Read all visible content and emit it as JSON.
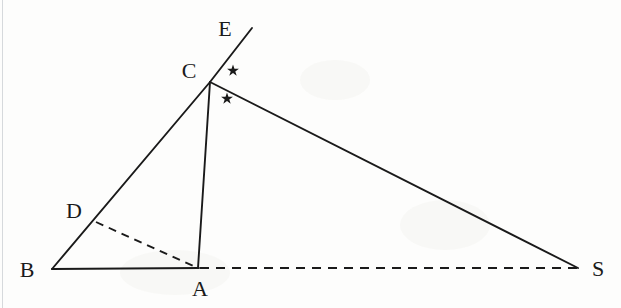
{
  "figure": {
    "type": "geometry-diagram",
    "background_color": "#fdfdfc",
    "stroke_color": "#1a1a1a",
    "labels": [
      {
        "name": "E",
        "text": "E",
        "x": 225,
        "y": 29
      },
      {
        "name": "C",
        "text": "C",
        "x": 189,
        "y": 71
      },
      {
        "name": "D",
        "text": "D",
        "x": 74,
        "y": 211
      },
      {
        "name": "B",
        "text": "B",
        "x": 27,
        "y": 270
      },
      {
        "name": "A",
        "text": "A",
        "x": 200,
        "y": 289
      },
      {
        "name": "S",
        "text": "S",
        "x": 598,
        "y": 269
      }
    ],
    "points": [
      {
        "name": "E",
        "x": 252,
        "y": 28
      },
      {
        "name": "C",
        "x": 210,
        "y": 82
      },
      {
        "name": "D",
        "x": 96,
        "y": 222
      },
      {
        "name": "B",
        "x": 52,
        "y": 269
      },
      {
        "name": "A",
        "x": 198,
        "y": 268
      },
      {
        "name": "S",
        "x": 578,
        "y": 268
      }
    ],
    "segments": [
      {
        "name": "segment-B-C",
        "from": "B",
        "to": "C",
        "style": "solid"
      },
      {
        "name": "segment-C-E",
        "from": "C",
        "to": "E",
        "style": "solid"
      },
      {
        "name": "segment-C-A",
        "from": "C",
        "to": "A",
        "style": "solid"
      },
      {
        "name": "segment-C-S",
        "from": "C",
        "to": "S",
        "style": "solid"
      },
      {
        "name": "segment-B-A",
        "from": "B",
        "to": "A",
        "style": "solid"
      },
      {
        "name": "segment-D-A",
        "from": "D",
        "to": "A",
        "style": "dashed"
      },
      {
        "name": "segment-A-S",
        "from": "A",
        "to": "S",
        "style": "dashed"
      }
    ],
    "angle_marks": [
      {
        "name": "angle-mark-upper-star",
        "symbol": "star",
        "x": 233,
        "y": 70
      },
      {
        "name": "angle-mark-lower-star",
        "symbol": "star",
        "x": 227,
        "y": 98
      }
    ]
  }
}
